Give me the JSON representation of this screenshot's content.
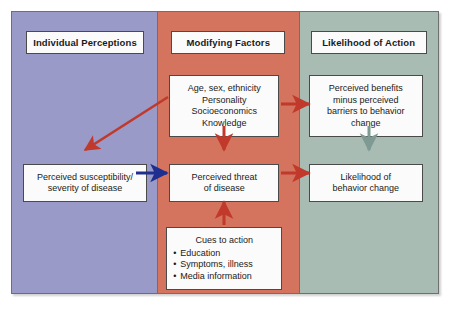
{
  "diagram": {
    "columns": [
      {
        "id": "individual-perceptions",
        "header": "Individual Perceptions",
        "color": "#9a9ac8"
      },
      {
        "id": "modifying-factors",
        "header": "Modifying Factors",
        "color": "#d4735e"
      },
      {
        "id": "likelihood-of-action",
        "header": "Likelihood of Action",
        "color": "#a8bcb4"
      }
    ],
    "nodes": {
      "susceptibility": {
        "line1": "Perceived susceptibility/",
        "line2": "severity of disease"
      },
      "demographics": {
        "line1": "Age, sex, ethnicity",
        "line2": "Personality",
        "line3": "Socioeconomics",
        "line4": "Knowledge"
      },
      "threat": {
        "line1": "Perceived threat",
        "line2": "of disease"
      },
      "cues": {
        "title": "Cues to action",
        "items": [
          "Education",
          "Symptoms, illness",
          "Media information"
        ]
      },
      "benefits": {
        "line1": "Perceived benefits",
        "line2": "minus perceived",
        "line3": "barriers to behavior",
        "line4": "change"
      },
      "likelihood": {
        "line1": "Likelihood of",
        "line2": "behavior change"
      }
    },
    "arrows": [
      {
        "id": "demographics-to-susceptibility",
        "color": "#c0392b",
        "direction": "diagonal-down-left"
      },
      {
        "id": "susceptibility-to-threat",
        "color": "#1f2f8f",
        "direction": "right"
      },
      {
        "id": "demographics-to-threat",
        "color": "#c0392b",
        "direction": "down"
      },
      {
        "id": "cues-to-threat",
        "color": "#c0392b",
        "direction": "up"
      },
      {
        "id": "demographics-to-benefits",
        "color": "#c0392b",
        "direction": "right"
      },
      {
        "id": "threat-to-likelihood",
        "color": "#c0392b",
        "direction": "right"
      },
      {
        "id": "benefits-to-likelihood",
        "color": "#7f9a92",
        "direction": "down"
      }
    ]
  }
}
